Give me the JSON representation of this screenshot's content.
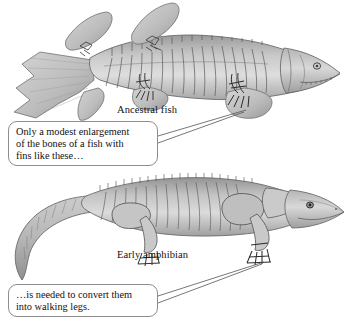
{
  "figure": {
    "background_color": "#ffffff",
    "ink_color": "#111111",
    "border_color": "#8d8d8d",
    "illustration_fill": "#b9b9b9",
    "illustration_shadow": "#8f8f8f",
    "illustration_highlight": "#dcdcdc"
  },
  "labels": {
    "ancestral_fish": "Ancestral fish",
    "early_amphibian": "Early amphibian"
  },
  "callouts": {
    "fish": {
      "name": "fish-fins-callout",
      "lines": [
        "Only a modest enlargement",
        "of the bones of a fish with",
        "fins like these…"
      ]
    },
    "amphibian": {
      "name": "walking-legs-callout",
      "lines": [
        "…is needed to convert them",
        "into walking legs."
      ]
    }
  },
  "illustrations": {
    "top": {
      "name": "ancestral-fish-illustration",
      "description": "Lobe-finned ancestral fish skeleton-shaded side view, facing right, with forked caudal fin at left, two dorsal fins, pectoral and pelvic lobed fins"
    },
    "bottom": {
      "name": "early-amphibian-illustration",
      "description": "Early amphibian side view, facing right, with curved tapering tail at left and four walking legs with digits"
    }
  }
}
